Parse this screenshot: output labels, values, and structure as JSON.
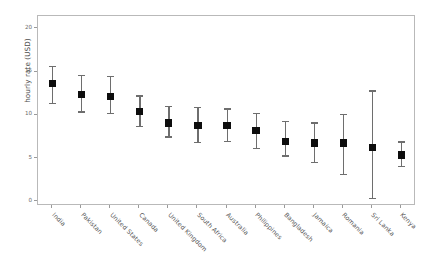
{
  "chart_data": {
    "type": "scatter",
    "title": "",
    "subtitle": "",
    "xlabel": "",
    "ylabel": "hourly rate (USD)",
    "ylim": [
      -0.5,
      21.5
    ],
    "yticks": [
      0,
      5,
      10,
      15,
      20
    ],
    "ytick_labels": [
      "0",
      "5",
      "10",
      "15",
      "20"
    ],
    "grid": false,
    "legend": false,
    "marker": "square",
    "error_bars": "vertical",
    "categories": [
      "India",
      "Pakistan",
      "United States",
      "Canada",
      "United Kingdom",
      "South Africa",
      "Australia",
      "Philippines",
      "Bangladesh",
      "Jamaica",
      "Romania",
      "Sri Lanka",
      "Kenya"
    ],
    "values": [
      13.7,
      12.4,
      12.2,
      10.4,
      9.1,
      8.8,
      8.8,
      8.2,
      7.0,
      6.8,
      6.8,
      6.3,
      5.4
    ],
    "lower": [
      11.3,
      10.3,
      10.1,
      8.6,
      7.4,
      6.8,
      6.9,
      6.1,
      5.2,
      4.5,
      3.1,
      0.3,
      4.0
    ],
    "upper": [
      15.7,
      14.7,
      14.6,
      12.3,
      11.1,
      11.0,
      10.8,
      10.3,
      9.4,
      9.2,
      10.2,
      12.9,
      7.0
    ],
    "series": [
      {
        "name": "hourly rate",
        "values": [
          13.7,
          12.4,
          12.2,
          10.4,
          9.1,
          8.8,
          8.8,
          8.2,
          7.0,
          6.8,
          6.8,
          6.3,
          5.4
        ]
      }
    ],
    "colors": {
      "marker": "#0d0d0d",
      "error_bar": "#6e6e6e",
      "axis": "#b9b9b9",
      "tick_label": "#6b6b6b",
      "axis_label": "#4d4d4d",
      "background": "#ffffff"
    }
  }
}
